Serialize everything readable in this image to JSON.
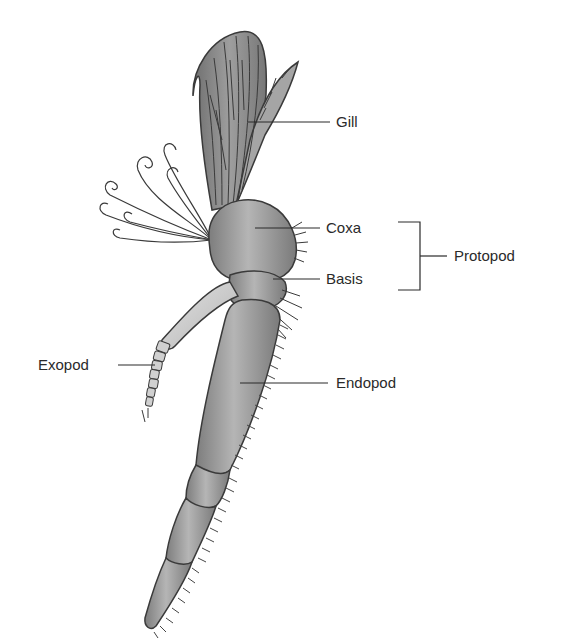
{
  "diagram": {
    "labels": {
      "gill": "Gill",
      "coxa": "Coxa",
      "basis": "Basis",
      "protopod": "Protopod",
      "exopod": "Exopod",
      "endopod": "Endopod"
    },
    "groupings": [
      {
        "group": "Protopod",
        "members": [
          "Coxa",
          "Basis"
        ]
      }
    ],
    "colors": {
      "background": "#ffffff",
      "limb_fill": "#9a9a9a",
      "limb_highlight": "#bdbdbd",
      "exopod_fill": "#cfcfcf",
      "outline": "#3a3a3a",
      "leader_line": "#2a2a2a",
      "text": "#2a2a2a"
    }
  }
}
